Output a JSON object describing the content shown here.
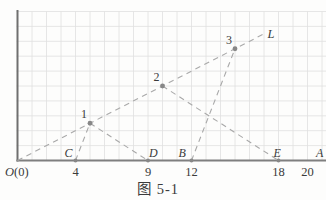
{
  "figure": {
    "caption": "图 5-1",
    "origin": {
      "name": "O",
      "paren": "(0)"
    },
    "axis_end_label": "A",
    "ray_end_label": "L",
    "x_ticks": [
      {
        "label": "4",
        "x": 4
      },
      {
        "label": "9",
        "x": 9
      },
      {
        "label": "12",
        "x": 12
      },
      {
        "label": "18",
        "x": 18
      },
      {
        "label": "20",
        "x": 20
      }
    ],
    "axis_points": [
      {
        "label": "C",
        "x": 4
      },
      {
        "label": "D",
        "x": 9
      },
      {
        "label": "B",
        "x": 12
      },
      {
        "label": "E",
        "x": 18
      }
    ],
    "ray_points": [
      {
        "label": "1",
        "x": 5,
        "y": 2.5
      },
      {
        "label": "2",
        "x": 10,
        "y": 5
      },
      {
        "label": "3",
        "x": 15,
        "y": 7.5
      }
    ],
    "ray": {
      "from": {
        "x": 0,
        "y": 0
      },
      "to": {
        "x": 17.1,
        "y": 8.55
      }
    },
    "segments": [
      {
        "from": "C",
        "to": "1"
      },
      {
        "from": "1",
        "to": "D"
      },
      {
        "from": "2",
        "to": "E"
      },
      {
        "from": "B",
        "to": "3"
      }
    ],
    "grid": {
      "cols": 21,
      "rows": 10
    },
    "colors": {
      "background": "#fdfdfc",
      "grid": "#e0e0e0",
      "axis": "#7f7f7f",
      "dash": "#a9a9a9",
      "dot": "#878787",
      "text": "#3b3b3b"
    }
  }
}
